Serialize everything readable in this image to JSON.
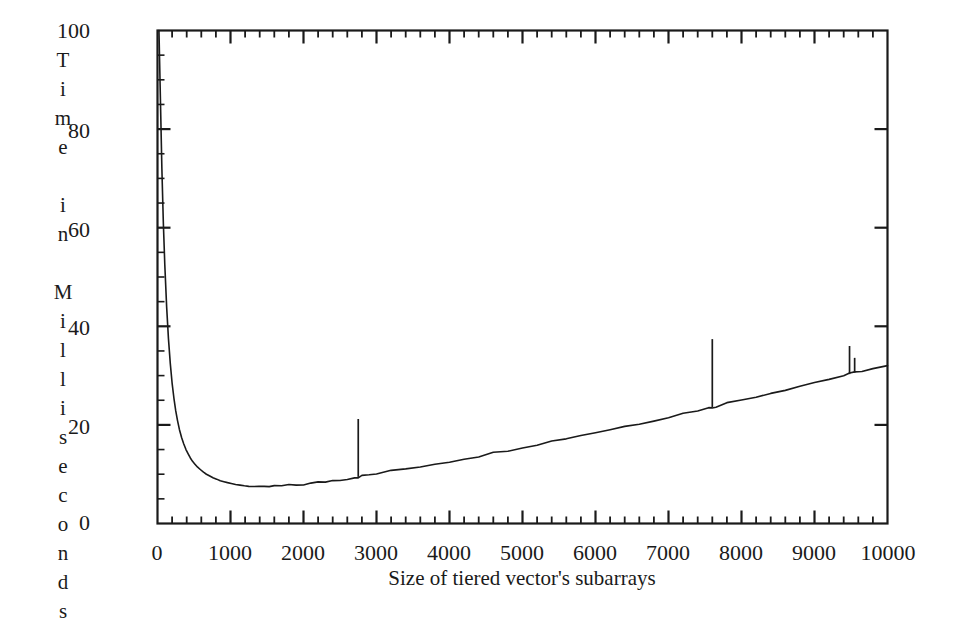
{
  "figure": {
    "background_color": "#ffffff",
    "ink_color": "#1a1a1a"
  },
  "chart_data": {
    "type": "line",
    "title": "",
    "subtitle": "",
    "xlabel": "Size of tiered vector's subarrays",
    "ylabel": "Time in Milliseconds",
    "ylabel_vertical_letters": [
      "T",
      "i",
      "m",
      "e",
      "",
      "i",
      "n",
      "",
      "M",
      "i",
      "l",
      "l",
      "i",
      "s",
      "e",
      "c",
      "o",
      "n",
      "d",
      "s"
    ],
    "xlim": [
      0,
      10000
    ],
    "ylim": [
      0,
      100
    ],
    "x_major_ticks": [
      0,
      1000,
      2000,
      3000,
      4000,
      5000,
      6000,
      7000,
      8000,
      9000,
      10000
    ],
    "x_tick_labels": [
      "0",
      "1000",
      "2000",
      "3000",
      "4000",
      "5000",
      "6000",
      "7000",
      "8000",
      "9000",
      "10000"
    ],
    "x_minor_tick_step": 200,
    "y_major_ticks": [
      0,
      20,
      40,
      60,
      80,
      100
    ],
    "y_tick_labels": [
      "0",
      "20",
      "40",
      "60",
      "80",
      "100"
    ],
    "y_minor_tick_step": 5,
    "grid": false,
    "legend": null,
    "frame": "box",
    "tick_direction": "in",
    "series": [
      {
        "name": "Time in Milliseconds",
        "color": "#1a1a1a",
        "line_width": 1.6,
        "x": [
          20,
          40,
          60,
          80,
          100,
          125,
          150,
          175,
          200,
          225,
          250,
          275,
          300,
          330,
          360,
          390,
          420,
          450,
          480,
          510,
          550,
          590,
          630,
          670,
          710,
          760,
          810,
          860,
          910,
          960,
          1010,
          1070,
          1130,
          1190,
          1250,
          1320,
          1390,
          1460,
          1530,
          1600,
          1700,
          1800,
          1900,
          2000,
          2100,
          2200,
          2300,
          2400,
          2500,
          2600,
          2700,
          2750,
          2800,
          2900,
          3000,
          3200,
          3400,
          3600,
          3800,
          4000,
          4200,
          4400,
          4600,
          4800,
          5000,
          5200,
          5400,
          5600,
          5800,
          6000,
          6200,
          6400,
          6600,
          6800,
          7000,
          7200,
          7400,
          7550,
          7600,
          7650,
          7800,
          8000,
          8200,
          8400,
          8600,
          8800,
          9000,
          9200,
          9400,
          9480,
          9550,
          9650,
          9800,
          10000
        ],
        "y": [
          100,
          86,
          72,
          61,
          52.5,
          44,
          37.5,
          32.5,
          28.5,
          25.4,
          22.8,
          20.8,
          19.1,
          17.4,
          16.1,
          15.0,
          14.1,
          13.3,
          12.6,
          12.1,
          11.4,
          10.9,
          10.4,
          10.0,
          9.7,
          9.3,
          9.0,
          8.7,
          8.5,
          8.3,
          8.1,
          7.9,
          7.8,
          7.65,
          7.55,
          7.5,
          7.5,
          7.5,
          7.5,
          7.55,
          7.6,
          7.7,
          7.8,
          7.95,
          8.1,
          8.3,
          8.5,
          8.7,
          8.9,
          9.1,
          9.35,
          9.45,
          9.6,
          9.85,
          10.1,
          10.6,
          11.1,
          11.6,
          12.1,
          12.6,
          13.2,
          13.7,
          14.3,
          14.9,
          15.5,
          16.1,
          16.7,
          17.3,
          17.9,
          18.5,
          19.1,
          19.7,
          20.3,
          21.0,
          21.6,
          22.3,
          23.0,
          23.4,
          23.6,
          23.8,
          24.4,
          25.1,
          25.8,
          26.5,
          27.2,
          27.9,
          28.6,
          29.3,
          30.0,
          30.3,
          30.6,
          31.0,
          31.4,
          31.9
        ],
        "spikes": [
          {
            "x": 2750,
            "baseline": 9.45,
            "peak": 21.2
          },
          {
            "x": 7600,
            "baseline": 23.6,
            "peak": 37.4
          },
          {
            "x": 9480,
            "baseline": 30.3,
            "peak": 36.0
          },
          {
            "x": 9550,
            "baseline": 30.6,
            "peak": 33.6
          }
        ],
        "notes": "Hyperbolic decay from 100 ms near x=0 to a minimum of about 7.5 ms near x=1300, followed by a nearly linear rise to about 32 ms at x=10000, with four narrow upward spikes."
      }
    ]
  }
}
